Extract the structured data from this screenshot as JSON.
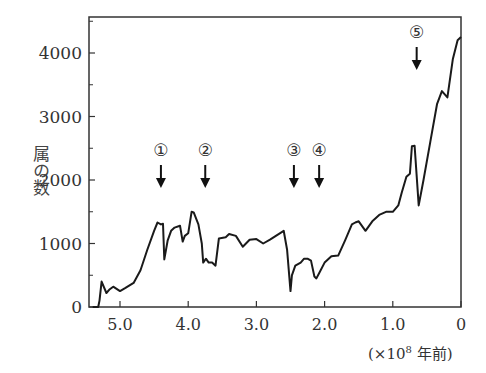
{
  "chart_data": {
    "type": "line",
    "title": "",
    "xlabel": "(×10^8 年前)",
    "xlabel_parts": {
      "open": "(×10",
      "exp": "8",
      "close": " 年前)"
    },
    "ylabel": "属の数",
    "xlim": [
      5.45,
      0
    ],
    "ylim": [
      0,
      4600
    ],
    "x_ticks": [
      5.0,
      4.0,
      3.0,
      2.0,
      1.0,
      0
    ],
    "x_tick_labels": [
      "5.0",
      "4.0",
      "3.0",
      "2.0",
      "1.0",
      "0"
    ],
    "y_ticks": [
      0,
      1000,
      2000,
      3000,
      4000
    ],
    "y_tick_labels": [
      "0",
      "1000",
      "2000",
      "3000",
      "4000"
    ],
    "y_minor_ticks": [
      500,
      1500,
      2500,
      3500,
      4500
    ],
    "grid": false,
    "series": [
      {
        "name": "属の数",
        "x": [
          5.4,
          5.32,
          5.3,
          5.27,
          5.2,
          5.15,
          5.1,
          5.0,
          4.92,
          4.8,
          4.7,
          4.6,
          4.5,
          4.45,
          4.4,
          4.37,
          4.35,
          4.3,
          4.25,
          4.2,
          4.12,
          4.08,
          4.05,
          4.0,
          3.95,
          3.92,
          3.85,
          3.8,
          3.78,
          3.74,
          3.7,
          3.65,
          3.6,
          3.55,
          3.45,
          3.4,
          3.3,
          3.2,
          3.1,
          3.0,
          2.9,
          2.8,
          2.6,
          2.55,
          2.5,
          2.48,
          2.43,
          2.35,
          2.3,
          2.25,
          2.2,
          2.15,
          2.12,
          2.08,
          2.0,
          1.9,
          1.8,
          1.7,
          1.6,
          1.55,
          1.5,
          1.4,
          1.3,
          1.2,
          1.1,
          1.0,
          0.92,
          0.87,
          0.8,
          0.75,
          0.72,
          0.68,
          0.62,
          0.55,
          0.45,
          0.35,
          0.28,
          0.2,
          0.12,
          0.05,
          0.0
        ],
        "y": [
          0,
          0,
          100,
          400,
          220,
          280,
          320,
          250,
          300,
          380,
          580,
          900,
          1200,
          1330,
          1300,
          1310,
          750,
          1050,
          1200,
          1250,
          1280,
          1030,
          1120,
          1160,
          1500,
          1490,
          1300,
          1000,
          700,
          760,
          700,
          700,
          650,
          1080,
          1100,
          1150,
          1120,
          950,
          1060,
          1070,
          1000,
          1060,
          1200,
          900,
          250,
          500,
          650,
          700,
          760,
          760,
          730,
          480,
          450,
          530,
          700,
          800,
          810,
          1050,
          1300,
          1330,
          1350,
          1200,
          1350,
          1450,
          1500,
          1500,
          1600,
          1800,
          2050,
          2100,
          2530,
          2540,
          1600,
          2000,
          2600,
          3200,
          3400,
          3300,
          3900,
          4200,
          4250
        ]
      }
    ],
    "annotations": [
      {
        "label": "①",
        "x": 4.4,
        "type": "arrow-down"
      },
      {
        "label": "②",
        "x": 3.75,
        "type": "arrow-down"
      },
      {
        "label": "③",
        "x": 2.45,
        "type": "arrow-down"
      },
      {
        "label": "④",
        "x": 2.08,
        "type": "arrow-down"
      },
      {
        "label": "⑤",
        "x": 0.65,
        "type": "arrow-down"
      }
    ]
  },
  "layout": {
    "plot_left": 89,
    "plot_right": 461,
    "plot_top": 17,
    "plot_bottom": 307,
    "line_color": "#1a1a1a",
    "axis_color": "#333333",
    "text_color": "#333333"
  }
}
